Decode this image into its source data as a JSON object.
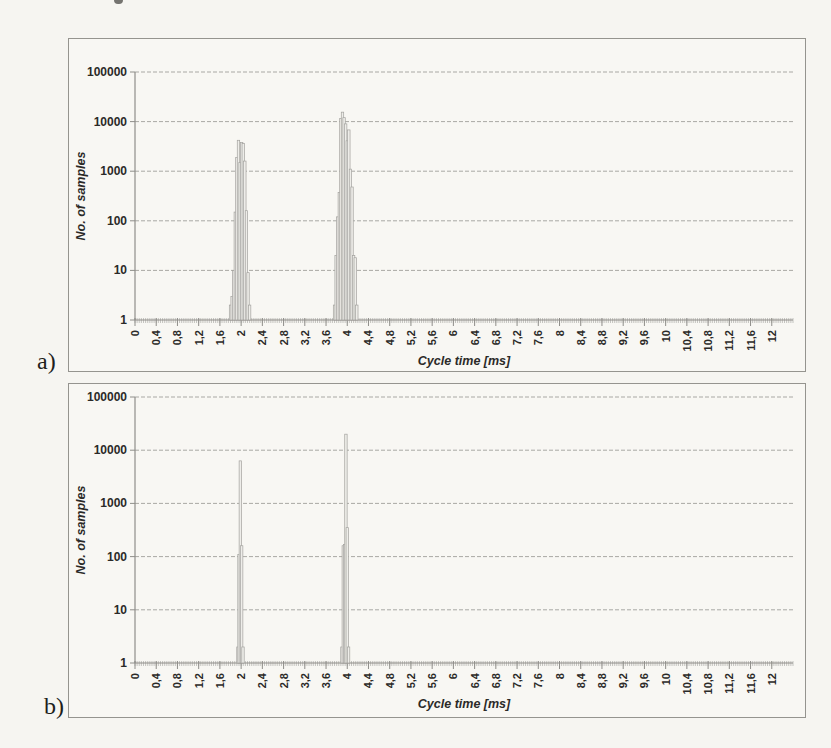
{
  "figure": {
    "panel_a_label": "a)",
    "panel_b_label": "b)"
  },
  "colors": {
    "bar_fill": "#eeede9",
    "bar_stroke": "#a3a29e",
    "grid": "#a9a8a4",
    "axis": "#8f8e8a",
    "text": "#2b2a28",
    "page_bg": "#f6f5f1",
    "panel_border": "#95948f"
  },
  "chart_data": [
    {
      "id": "a",
      "type": "bar",
      "title": "",
      "xlabel": "Cycle time [ms]",
      "ylabel": "No. of samples",
      "grid": true,
      "legend": "none",
      "x_axis": {
        "min": 0,
        "max": 12.4,
        "tick_step": 0.4,
        "minor_tick_step": 0.04,
        "tick_labels": [
          "0",
          "0,4",
          "0,8",
          "1,2",
          "1,6",
          "2",
          "2,4",
          "2,8",
          "3,2",
          "3,6",
          "4",
          "4,4",
          "4,8",
          "5,2",
          "5,6",
          "6",
          "6,4",
          "6,8",
          "7,2",
          "7,6",
          "8",
          "8,4",
          "8,8",
          "9,2",
          "9,6",
          "10",
          "10,4",
          "10,8",
          "11,2",
          "11,6",
          "12"
        ]
      },
      "y_axis": {
        "scale": "log",
        "min": 1,
        "max": 100000,
        "tick_labels": [
          "1",
          "10",
          "100",
          "1000",
          "10000",
          "100000"
        ]
      },
      "bars": [
        [
          1.8,
          2
        ],
        [
          1.83,
          3
        ],
        [
          1.86,
          10
        ],
        [
          1.89,
          150
        ],
        [
          1.92,
          1900
        ],
        [
          1.95,
          4200
        ],
        [
          1.98,
          1500
        ],
        [
          2.01,
          3800
        ],
        [
          2.04,
          3600
        ],
        [
          2.07,
          1600
        ],
        [
          2.1,
          160
        ],
        [
          2.13,
          9
        ],
        [
          2.16,
          2
        ],
        [
          3.76,
          2
        ],
        [
          3.79,
          20
        ],
        [
          3.82,
          120
        ],
        [
          3.85,
          370
        ],
        [
          3.88,
          11500
        ],
        [
          3.91,
          15500
        ],
        [
          3.94,
          12000
        ],
        [
          3.97,
          9000
        ],
        [
          4.0,
          4100
        ],
        [
          4.03,
          6800
        ],
        [
          4.06,
          1100
        ],
        [
          4.09,
          480
        ],
        [
          4.12,
          20
        ],
        [
          4.15,
          18
        ],
        [
          4.18,
          2
        ]
      ]
    },
    {
      "id": "b",
      "type": "bar",
      "title": "",
      "xlabel": "Cycle time [ms]",
      "ylabel": "No. of samples",
      "grid": true,
      "legend": "none",
      "x_axis": {
        "min": 0,
        "max": 12.4,
        "tick_step": 0.4,
        "minor_tick_step": 0.04,
        "tick_labels": [
          "0",
          "0,4",
          "0,8",
          "1,2",
          "1,6",
          "2",
          "2,4",
          "2,8",
          "3,2",
          "3,6",
          "4",
          "4,4",
          "4,8",
          "5,2",
          "5,6",
          "6",
          "6,4",
          "6,8",
          "7,2",
          "7,6",
          "8",
          "8,4",
          "8,8",
          "9,2",
          "9,6",
          "10",
          "10,4",
          "10,8",
          "11,2",
          "11,6",
          "12"
        ]
      },
      "y_axis": {
        "scale": "log",
        "min": 1,
        "max": 100000,
        "tick_labels": [
          "1",
          "10",
          "100",
          "1000",
          "10000",
          "100000"
        ]
      },
      "bars": [
        [
          1.94,
          2
        ],
        [
          1.96,
          110
        ],
        [
          1.985,
          6300
        ],
        [
          2.01,
          160
        ],
        [
          2.035,
          2
        ],
        [
          3.9,
          2
        ],
        [
          3.925,
          160
        ],
        [
          3.95,
          170
        ],
        [
          3.975,
          20000
        ],
        [
          4.0,
          350
        ],
        [
          4.025,
          2
        ]
      ]
    }
  ]
}
